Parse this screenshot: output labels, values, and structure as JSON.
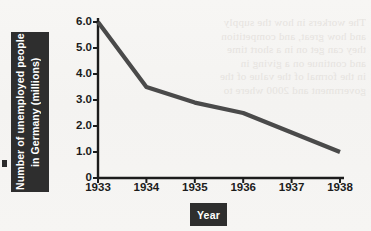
{
  "chart_data": {
    "type": "line",
    "title": "",
    "xlabel": "Year",
    "ylabel": "Number of unemployed people in Germany (millions)",
    "categories": [
      "1933",
      "1934",
      "1935",
      "1936",
      "1937",
      "1938"
    ],
    "x": [
      1933,
      1934,
      1935,
      1936,
      1937,
      1938
    ],
    "values": [
      6.0,
      3.5,
      2.9,
      2.5,
      1.75,
      1.0
    ],
    "series": [
      {
        "name": "Unemployed people in Germany (millions)",
        "values": [
          6.0,
          3.5,
          2.9,
          2.5,
          1.75,
          1.0
        ]
      }
    ],
    "ylim": [
      0,
      6.0
    ],
    "xlim": [
      1933,
      1938
    ],
    "ytick_labels": [
      "0",
      "1.0",
      "2.0",
      "3.0",
      "4.0",
      "5.0",
      "6.0"
    ],
    "ytick_values": [
      0,
      1.0,
      2.0,
      3.0,
      4.0,
      5.0,
      6.0
    ],
    "xtick_labels": [
      "1933",
      "1934",
      "1935",
      "1936",
      "1937",
      "1938"
    ],
    "grid": false,
    "legend": false,
    "legend_position": "none",
    "line_color": "#4a4a4a",
    "axis_color": "#1c1c1c",
    "background_color": "#f6f5f3",
    "label_box_color": "#2e2e2e",
    "label_text_color": "#ffffff"
  },
  "axis_titles": {
    "y_title": "Number of unemployed people in Germany (millions)",
    "x_title": "Year"
  },
  "bleed_text": {
    "lines": [
      "The workers in how the supply",
      "and how great, and competition",
      "they can get on in a short time",
      "and continue on a giving in",
      "in the formal of the value of the",
      "government and 2000 where to"
    ]
  }
}
